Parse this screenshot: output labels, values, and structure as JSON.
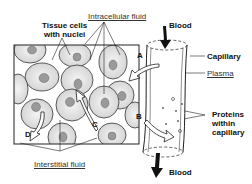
{
  "labels": {
    "tissue_cells": "Tissue cells",
    "with_nuclei": "with nuclei",
    "intracellular_fluid": "Intracellular fluid",
    "blood_in": "Blood",
    "capillary": "Capillary",
    "plasma": "Plasma",
    "proteins_1": "Proteins",
    "proteins_2": "within",
    "proteins_3": "capillary",
    "interstitial_fluid": "Interstitial fluid",
    "blood_out": "Blood",
    "arrow_a": "A",
    "arrow_b": "B",
    "arrow_c": "C",
    "arrow_d": "D"
  },
  "colors": {
    "cell_fill": "#e6e6e6",
    "nucleus_fill": "#9a9a9a",
    "line": "#222222"
  }
}
